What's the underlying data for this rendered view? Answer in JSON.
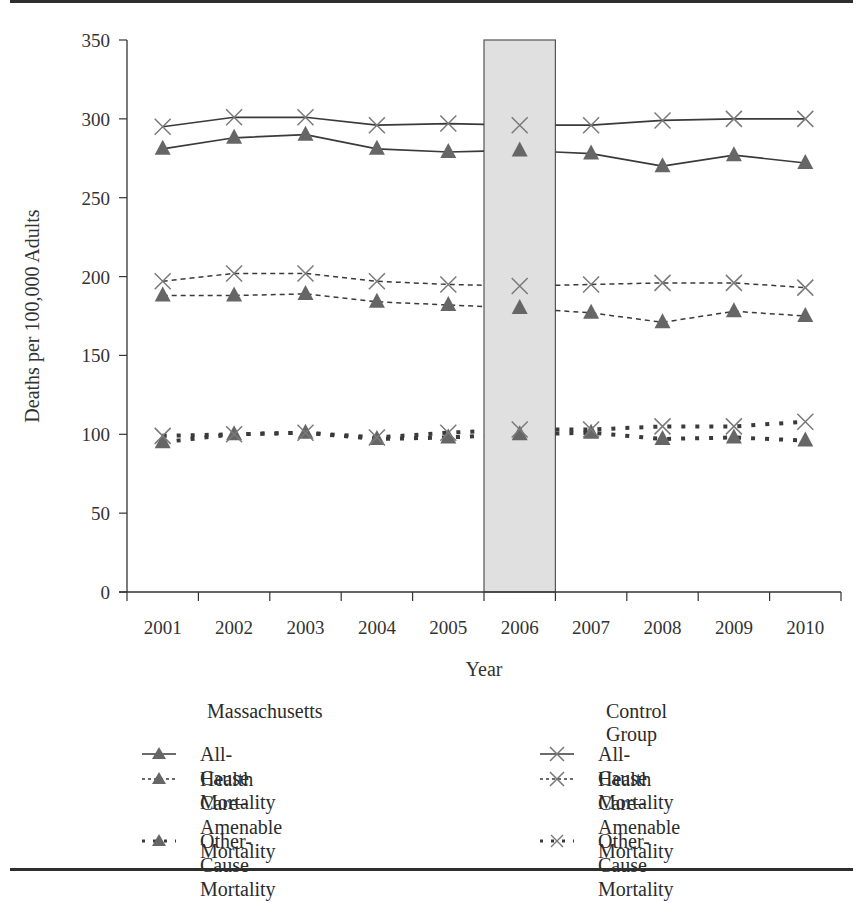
{
  "chart_data": {
    "type": "line",
    "title": "",
    "xlabel": "Year",
    "ylabel": "Deaths per 100,000 Adults",
    "ylim": [
      0,
      350
    ],
    "yticks": [
      0,
      50,
      100,
      150,
      200,
      250,
      300,
      350
    ],
    "categories": [
      "2001",
      "2002",
      "2003",
      "2004",
      "2005",
      "2006",
      "2007",
      "2008",
      "2009",
      "2010"
    ],
    "grid": false,
    "highlight_band": {
      "category": "2006",
      "fill": "#e0e0e0",
      "note": "shaded year (line breaks across it)"
    },
    "series": [
      {
        "name": "All-Cause Mortality",
        "group": "Massachusetts",
        "line_style": "solid",
        "marker": "triangle",
        "values": [
          281,
          288,
          290,
          281,
          279,
          280,
          278,
          270,
          277,
          272
        ]
      },
      {
        "name": "Health Care–Amenable Mortality",
        "group": "Massachusetts",
        "line_style": "dashed",
        "marker": "triangle",
        "values": [
          188,
          188,
          189,
          184,
          182,
          180,
          177,
          171,
          178,
          175
        ]
      },
      {
        "name": "Other-Cause Mortality",
        "group": "Massachusetts",
        "line_style": "dotted",
        "marker": "triangle",
        "values": [
          95,
          100,
          101,
          97,
          98,
          100,
          101,
          97,
          98,
          96
        ]
      },
      {
        "name": "All-Cause Mortality",
        "group": "Control Group",
        "line_style": "solid",
        "marker": "x",
        "values": [
          295,
          301,
          301,
          296,
          297,
          296,
          296,
          299,
          300,
          300
        ]
      },
      {
        "name": "Health Care–Amenable Mortality",
        "group": "Control Group",
        "line_style": "dashed",
        "marker": "x",
        "values": [
          197,
          202,
          202,
          197,
          195,
          194,
          195,
          196,
          196,
          193
        ]
      },
      {
        "name": "Other-Cause Mortality",
        "group": "Control Group",
        "line_style": "dotted",
        "marker": "x",
        "values": [
          99,
          100,
          101,
          98,
          101,
          103,
          103,
          105,
          105,
          108
        ]
      }
    ],
    "legend": {
      "placement": "bottom",
      "groups": [
        {
          "title": "Massachusetts",
          "items": [
            "All-Cause Mortality",
            "Health Care–Amenable Mortality",
            "Other-Cause Mortality"
          ]
        },
        {
          "title": "Control Group",
          "items": [
            "All-Cause Mortality",
            "Health Care–Amenable Mortality",
            "Other-Cause Mortality"
          ]
        }
      ]
    },
    "colors": {
      "line": "#3a3a3a",
      "triangle_marker": "#666666",
      "x_marker": "#7a7a7a",
      "band": "#e0e0e0"
    }
  },
  "legend_labels": {
    "left_title": "Massachusetts",
    "right_title": "Control Group",
    "left": [
      {
        "line1": "All-Cause Mortality",
        "line2": ""
      },
      {
        "line1": "Health Care–Amenable",
        "line2": "Mortality"
      },
      {
        "line1": "Other-Cause Mortality",
        "line2": ""
      }
    ],
    "right": [
      {
        "line1": "All-Cause Mortality",
        "line2": ""
      },
      {
        "line1": "Health Care–Amenable",
        "line2": "Mortality"
      },
      {
        "line1": "Other-Cause Mortality",
        "line2": ""
      }
    ]
  }
}
